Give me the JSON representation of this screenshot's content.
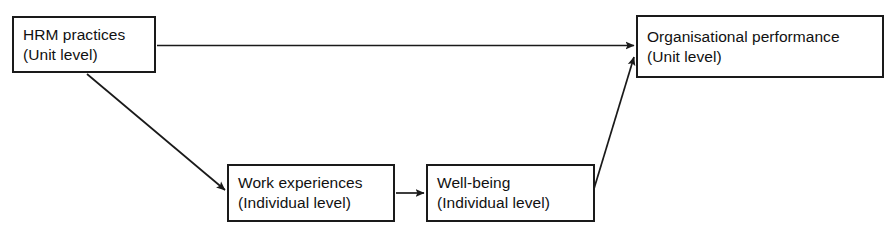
{
  "diagram": {
    "stroke_color": "#1a1a1a",
    "background_color": "#ffffff",
    "nodes": [
      {
        "id": "hrm",
        "line1": "HRM practices",
        "line2": "(Unit level)"
      },
      {
        "id": "organisational_performance",
        "line1": "Organisational performance",
        "line2": "(Unit level)"
      },
      {
        "id": "work_experiences",
        "line1": "Work experiences",
        "line2": "(Individual level)"
      },
      {
        "id": "well_being",
        "line1": "Well-being",
        "line2": "(Individual level)"
      }
    ],
    "edges": [
      {
        "id": "hrm-to-org",
        "from": "hrm",
        "to": "organisational_performance",
        "style": "straight-horizontal"
      },
      {
        "id": "hrm-to-work",
        "from": "hrm",
        "to": "work_experiences",
        "style": "diagonal-down-right"
      },
      {
        "id": "work-to-wellbeing",
        "from": "work_experiences",
        "to": "well_being",
        "style": "straight-horizontal"
      },
      {
        "id": "wellbeing-to-org",
        "from": "well_being",
        "to": "organisational_performance",
        "style": "diagonal-up-right"
      }
    ]
  }
}
